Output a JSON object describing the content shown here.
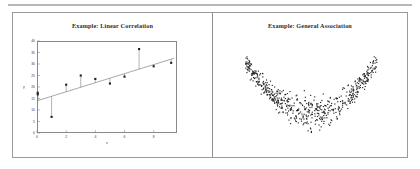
{
  "figure": {
    "panels": [
      {
        "id": "linear-correlation",
        "title": "Example: Linear Correlation"
      },
      {
        "id": "general-association",
        "title": "Example: General Association"
      }
    ]
  },
  "chart_data": [
    {
      "type": "scatter",
      "id": "linear-correlation",
      "title": "Example: Linear Correlation",
      "xlabel": "x",
      "ylabel": "y",
      "xlim": [
        0,
        9.6
      ],
      "ylim": [
        0,
        40
      ],
      "grid": false,
      "legend": null,
      "xticks": [
        0,
        2,
        4,
        6,
        8
      ],
      "xtick_labels": [
        "0",
        "2",
        "4",
        "6",
        "8"
      ],
      "yticks": [
        0,
        5,
        10,
        15,
        20,
        25,
        30,
        35,
        40
      ],
      "ytick_labels": [
        "0",
        "5",
        "10",
        "15",
        "20",
        "25",
        "30",
        "35",
        "40"
      ],
      "series": [
        {
          "name": "observations",
          "marker": "square",
          "x": [
            0.05,
            0.05,
            1.0,
            2.0,
            3.0,
            4.0,
            5.0,
            6.0,
            7.0,
            8.0,
            9.2
          ],
          "y": [
            17.5,
            16.8,
            7.0,
            21.0,
            25.0,
            23.5,
            21.5,
            24.5,
            36.5,
            29.0,
            30.5
          ]
        },
        {
          "name": "fitted line",
          "type": "line",
          "x": [
            0.0,
            9.4
          ],
          "y": [
            14.0,
            32.5
          ]
        }
      ],
      "residual_lines": true,
      "annotations": []
    },
    {
      "type": "scatter",
      "id": "general-association",
      "title": "Example: General Association",
      "xlabel": "",
      "ylabel": "",
      "grid": false,
      "legend": null,
      "axes_visible": false,
      "n_points": 620,
      "pattern": "u-shaped crescent cloud",
      "description": "Dense cloud of small points forming a wide U / crescent with thin upward-curving tails at both ends"
    }
  ]
}
